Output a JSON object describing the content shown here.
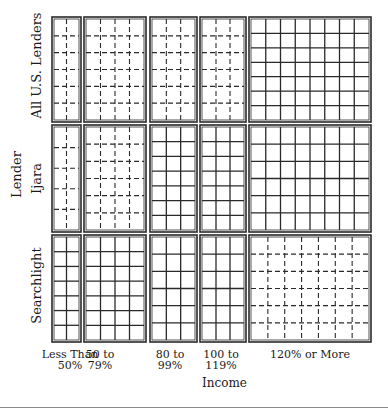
{
  "chart_data": {
    "type": "mosaic",
    "title": "",
    "xlabel": "Income",
    "ylabel": "Lender",
    "x_categories": [
      "Less Than 50%",
      "50 to 79%",
      "80 to 99%",
      "100 to 119%",
      "120% or More"
    ],
    "x_category_lines": [
      [
        "Less Than",
        "50%"
      ],
      [
        "50 to",
        "79%"
      ],
      [
        "80 to",
        "99%"
      ],
      [
        "100 to",
        "119%"
      ],
      [
        "120% or More",
        ""
      ]
    ],
    "y_categories": [
      "All U.S. Lenders",
      "Ijara",
      "Searchlight"
    ],
    "column_widths_px": [
      29,
      62,
      47,
      46,
      122
    ],
    "row_heights_px": [
      105,
      107,
      107
    ],
    "cells": [
      [
        {
          "style": "dashed",
          "vlines": 1,
          "hlines": 5
        },
        {
          "style": "dashed",
          "vlines": 3,
          "hlines": 5
        },
        {
          "style": "dashed",
          "vlines": 2,
          "hlines": 5
        },
        {
          "style": "dashed",
          "vlines": 2,
          "hlines": 5
        },
        {
          "style": "solid",
          "vlines": 7,
          "hlines": 6
        }
      ],
      [
        {
          "style": "dashed",
          "vlines": 1,
          "hlines": 4
        },
        {
          "style": "dashed",
          "vlines": 3,
          "hlines": 5
        },
        {
          "style": "solid",
          "vlines": 2,
          "hlines": 6
        },
        {
          "style": "solid",
          "vlines": 2,
          "hlines": 6
        },
        {
          "style": "solid",
          "vlines": 7,
          "hlines": 5
        }
      ],
      [
        {
          "style": "solid",
          "vlines": 1,
          "hlines": 6
        },
        {
          "style": "solid",
          "vlines": 3,
          "hlines": 6
        },
        {
          "style": "solid",
          "vlines": 2,
          "hlines": 5
        },
        {
          "style": "solid",
          "vlines": 2,
          "hlines": 5
        },
        {
          "style": "dashed",
          "vlines": 6,
          "hlines": 5
        }
      ]
    ],
    "legend": "line style: solid = observed above expected, dashed = observed below expected",
    "grid": false
  },
  "colors": {
    "line": "#2a2a2a",
    "background": "#ffffff"
  }
}
